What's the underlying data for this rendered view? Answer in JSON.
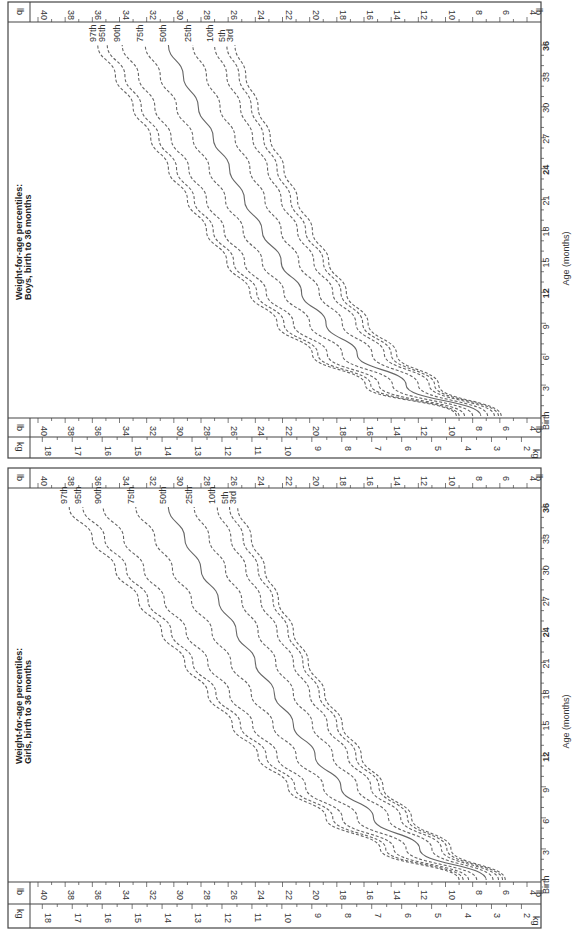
{
  "page": {
    "orientation": "rotated-90-ccw"
  },
  "chart_data": [
    {
      "type": "line",
      "title": "Weight-for-age percentiles:",
      "subtitle": "Boys, birth to 36 months",
      "xlabel": "Age (months)",
      "ylabel_left": "lb",
      "ylabel_right": "kg",
      "x_ticks": [
        "Birth",
        "3",
        "6",
        "9",
        "12",
        "15",
        "18",
        "21",
        "24",
        "27",
        "30",
        "33",
        "36"
      ],
      "lb_ticks": [
        4,
        6,
        8,
        10,
        12,
        14,
        16,
        18,
        20,
        22,
        24,
        26,
        28,
        30,
        32,
        34,
        36,
        38,
        40
      ],
      "kg_ticks": [
        2,
        3,
        4,
        5,
        6,
        7,
        8,
        9,
        10,
        11,
        12,
        13,
        14,
        15,
        16,
        17,
        18
      ],
      "xlim": [
        0,
        36
      ],
      "ylim_lb": [
        4,
        40
      ],
      "grid": false,
      "x": [
        0,
        3,
        6,
        9,
        12,
        15,
        18,
        21,
        24,
        27,
        30,
        33,
        36
      ],
      "series": [
        {
          "name": "97th",
          "style": "dashed",
          "values": [
            9.2,
            15.9,
            19.8,
            22.4,
            24.4,
            26.1,
            27.6,
            29.0,
            30.4,
            31.7,
            33.0,
            34.3,
            35.6
          ]
        },
        {
          "name": "95th",
          "style": "dashed",
          "values": [
            9.0,
            15.5,
            19.4,
            21.9,
            23.9,
            25.6,
            27.1,
            28.5,
            29.8,
            31.1,
            32.4,
            33.6,
            34.9
          ]
        },
        {
          "name": "90th",
          "style": "dashed",
          "values": [
            8.6,
            14.9,
            18.7,
            21.2,
            23.2,
            24.8,
            26.3,
            27.6,
            28.9,
            30.2,
            31.4,
            32.6,
            33.8
          ]
        },
        {
          "name": "75th",
          "style": "dashed",
          "values": [
            8.0,
            13.9,
            17.6,
            20.0,
            21.9,
            23.5,
            24.9,
            26.2,
            27.4,
            28.6,
            29.8,
            31.0,
            32.1
          ]
        },
        {
          "name": "50th",
          "style": "solid",
          "values": [
            7.4,
            12.9,
            16.5,
            18.8,
            20.6,
            22.1,
            23.5,
            24.8,
            25.9,
            27.1,
            28.2,
            29.3,
            30.4
          ]
        },
        {
          "name": "25th",
          "style": "dashed",
          "values": [
            6.9,
            12.0,
            15.4,
            17.6,
            19.3,
            20.8,
            22.1,
            23.3,
            24.4,
            25.5,
            26.6,
            27.6,
            28.6
          ]
        },
        {
          "name": "10th",
          "style": "dashed",
          "values": [
            6.4,
            11.2,
            14.5,
            16.6,
            18.3,
            19.7,
            20.9,
            22.1,
            23.1,
            24.2,
            25.1,
            26.1,
            27.0
          ]
        },
        {
          "name": "5th",
          "style": "dashed",
          "values": [
            6.1,
            10.8,
            14.0,
            16.1,
            17.7,
            19.0,
            20.3,
            21.4,
            22.4,
            23.4,
            24.3,
            25.2,
            26.1
          ]
        },
        {
          "name": "3rd",
          "style": "dashed",
          "values": [
            5.9,
            10.5,
            13.6,
            15.7,
            17.3,
            18.6,
            19.8,
            20.9,
            21.9,
            22.9,
            23.8,
            24.7,
            25.5
          ]
        }
      ]
    },
    {
      "type": "line",
      "title": "Weight-for-age percentiles:",
      "subtitle": "Girls, birth to 36 months",
      "xlabel": "Age (months)",
      "ylabel_left": "lb",
      "ylabel_right": "kg",
      "x_ticks": [
        "Birth",
        "3",
        "6",
        "9",
        "12",
        "15",
        "18",
        "21",
        "24",
        "27",
        "30",
        "33",
        "36"
      ],
      "lb_ticks": [
        4,
        6,
        8,
        10,
        12,
        14,
        16,
        18,
        20,
        22,
        24,
        26,
        28,
        30,
        32,
        34,
        36,
        38,
        40
      ],
      "kg_ticks": [
        2,
        3,
        4,
        5,
        6,
        7,
        8,
        9,
        10,
        11,
        12,
        13,
        14,
        15,
        16,
        17,
        18
      ],
      "xlim": [
        0,
        36
      ],
      "ylim_lb": [
        4,
        40
      ],
      "grid": false,
      "x": [
        0,
        3,
        6,
        9,
        12,
        15,
        18,
        21,
        24,
        27,
        30,
        33,
        36
      ],
      "series": [
        {
          "name": "97th",
          "style": "dashed",
          "values": [
            9.0,
            14.8,
            18.8,
            21.6,
            23.8,
            25.7,
            27.5,
            29.2,
            30.9,
            32.6,
            34.3,
            36.0,
            37.7
          ]
        },
        {
          "name": "95th",
          "style": "dashed",
          "values": [
            8.7,
            14.4,
            18.3,
            21.1,
            23.2,
            25.1,
            26.9,
            28.6,
            30.2,
            31.9,
            33.5,
            35.1,
            36.7
          ]
        },
        {
          "name": "90th",
          "style": "dashed",
          "values": [
            8.3,
            13.8,
            17.6,
            20.3,
            22.4,
            24.2,
            25.9,
            27.5,
            29.1,
            30.7,
            32.2,
            33.7,
            35.2
          ]
        },
        {
          "name": "75th",
          "style": "dashed",
          "values": [
            7.7,
            12.9,
            16.5,
            19.0,
            21.0,
            22.7,
            24.3,
            25.8,
            27.2,
            28.7,
            30.1,
            31.4,
            32.8
          ]
        },
        {
          "name": "50th",
          "style": "solid",
          "values": [
            7.0,
            11.9,
            15.3,
            17.7,
            19.6,
            21.2,
            22.6,
            24.0,
            25.4,
            26.7,
            28.0,
            29.2,
            30.4
          ]
        },
        {
          "name": "25th",
          "style": "dashed",
          "values": [
            6.5,
            11.0,
            14.2,
            16.5,
            18.3,
            19.8,
            21.2,
            22.5,
            23.8,
            25.0,
            26.2,
            27.4,
            28.5
          ]
        },
        {
          "name": "10th",
          "style": "dashed",
          "values": [
            6.1,
            10.3,
            13.3,
            15.5,
            17.2,
            18.7,
            20.0,
            21.2,
            22.4,
            23.6,
            24.7,
            25.8,
            26.8
          ]
        },
        {
          "name": "5th",
          "style": "dashed",
          "values": [
            5.8,
            9.9,
            12.8,
            14.9,
            16.6,
            18.0,
            19.3,
            20.5,
            21.6,
            22.7,
            23.8,
            24.9,
            25.9
          ]
        },
        {
          "name": "3rd",
          "style": "dashed",
          "values": [
            5.6,
            9.6,
            12.5,
            14.6,
            16.2,
            17.6,
            18.9,
            20.1,
            21.2,
            22.3,
            23.3,
            24.3,
            25.3
          ]
        }
      ]
    }
  ],
  "layout_colors": {
    "axis": "#444444",
    "curve": "#666666",
    "text": "#333333"
  }
}
